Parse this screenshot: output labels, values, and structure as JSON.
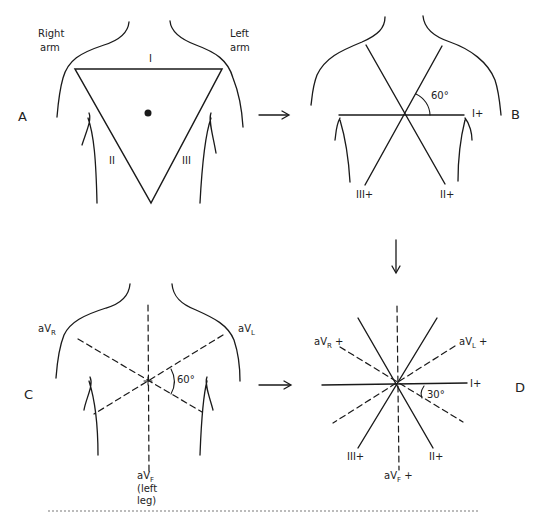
{
  "figure": {
    "panels": {
      "A": {
        "letter": "A",
        "labels": {
          "right_arm": [
            "Right",
            "arm"
          ],
          "left_arm": [
            "Left",
            "arm"
          ],
          "lead_I": "I",
          "lead_II": "II",
          "lead_III": "III"
        }
      },
      "B": {
        "letter": "B",
        "labels": {
          "angle": "60°",
          "lead_I_pos": "I+",
          "lead_II_pos": "II+",
          "lead_III_pos": "III+"
        }
      },
      "C": {
        "letter": "C",
        "labels": {
          "aVR_main": "aV",
          "aVR_sub": "R",
          "aVL_main": "aV",
          "aVL_sub": "L",
          "aVF_main": "aV",
          "aVF_sub": "F",
          "aVF_note": [
            "(left",
            "leg)"
          ],
          "angle": "60°"
        }
      },
      "D": {
        "letter": "D",
        "labels": {
          "aVR_main": "aV",
          "aVR_sub": "R",
          "aVR_sign": "+",
          "aVL_main": "aV",
          "aVL_sub": "L",
          "aVL_sign": "+",
          "aVF_main": "aV",
          "aVF_sub": "F",
          "aVF_sign": "+",
          "lead_I_pos": "I+",
          "lead_II_pos": "II+",
          "lead_III_pos": "III+",
          "angle": "30°"
        }
      }
    },
    "arrows": [
      "A-to-B",
      "B-to-D",
      "C-to-D"
    ],
    "colors": {
      "line": "#1a1a1a",
      "background": "#ffffff"
    }
  }
}
